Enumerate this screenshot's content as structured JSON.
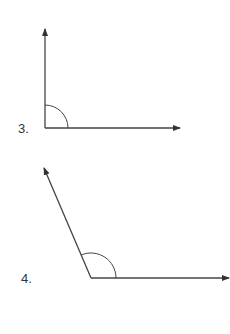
{
  "figures": [
    {
      "label": "3.",
      "vertex": [
        45,
        128
      ],
      "ray1_end": [
        45,
        28
      ],
      "ray2_end": [
        180,
        128
      ],
      "arc_radius": 23,
      "angle_type": "right"
    },
    {
      "label": "4.",
      "vertex": [
        91,
        278
      ],
      "ray1_end": [
        43,
        167
      ],
      "ray2_end": [
        229,
        278
      ],
      "arc_radius": 25,
      "angle_type": "obtuse"
    }
  ],
  "colors": {
    "line": "#444444",
    "text": "#333333",
    "background": "#ffffff"
  }
}
